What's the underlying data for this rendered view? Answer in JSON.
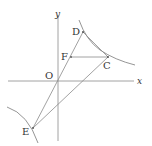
{
  "diagram": {
    "type": "coordinate-geometry",
    "axes": {
      "x_label": "x",
      "y_label": "y",
      "origin_label": "O"
    },
    "points": {
      "D": {
        "label": "D",
        "x": 83,
        "y": 32
      },
      "C": {
        "label": "C",
        "x": 108,
        "y": 57
      },
      "F": {
        "label": "F",
        "x": 71,
        "y": 57
      },
      "O": {
        "label": "O",
        "x": 58,
        "y": 81
      },
      "E": {
        "label": "E",
        "x": 33,
        "y": 128
      }
    },
    "segments": [
      "D-E",
      "D-C",
      "F-C",
      "C-E"
    ],
    "curves": [
      "hyperbola-branch-upper-right",
      "hyperbola-branch-lower-left"
    ],
    "colors": {
      "line": "#8a8a8a",
      "curve": "#7a7a7a",
      "text": "#333333"
    }
  }
}
